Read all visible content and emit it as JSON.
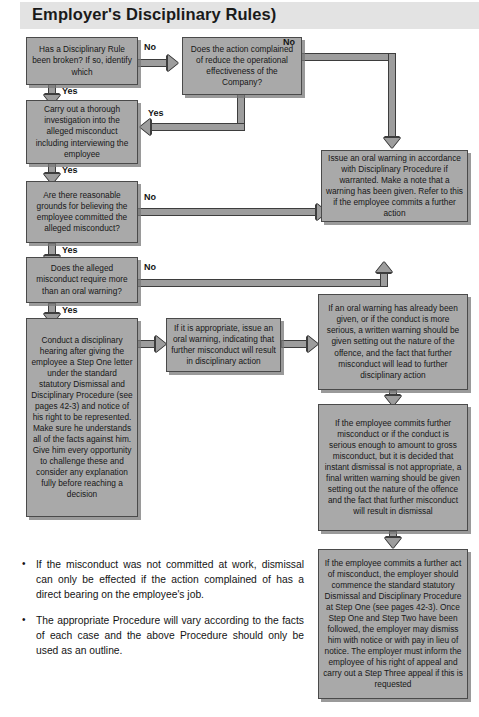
{
  "page": {
    "title": "Employer's Disciplinary Rules)"
  },
  "flowchart": {
    "type": "flowchart",
    "nodes": [
      {
        "id": "n1",
        "text": "Has a Disciplinary Rule been broken? If so, identify which"
      },
      {
        "id": "n2",
        "text": "Does the action complained of reduce the operational effectiveness of the Company?"
      },
      {
        "id": "n3",
        "text": "Carry out a thorough investigation into the alleged misconduct including interviewing the employee"
      },
      {
        "id": "n4",
        "text": "Are there reasonable grounds for believing the employee committed the alleged misconduct?"
      },
      {
        "id": "n5",
        "text": "Issue an oral warning in accordance with Disciplinary Procedure if warranted. Make a note that a warning has been given. Refer to this if the employee commits a further action"
      },
      {
        "id": "n6",
        "text": "Does the alleged misconduct require more than an oral warning?"
      },
      {
        "id": "n7",
        "text": "Conduct a disciplinary hearing after giving the employee a Step One letter under the standard statutory Dismissal and Disciplinary Procedure (see pages 42-3) and notice of his right to be represented. Make sure he understands all of the facts against him. Give him every opportunity to challenge these and consider any explanation fully before reaching a decision"
      },
      {
        "id": "n8",
        "text": "If it is appropriate, issue an oral warning, indicating that further misconduct will result in disciplinary action"
      },
      {
        "id": "n9",
        "text": "If an oral warning has already been given, or if the conduct is more serious, a written warning should be given setting out the nature of the offence, and the fact that further misconduct will lead to further disciplinary action"
      },
      {
        "id": "n10",
        "text": "If the employee commits further misconduct or if the conduct is serious enough to amount to gross misconduct, but it is decided that instant dismissal is not appropriate, a final written warning should be given setting out the nature of the offence and the fact that further misconduct will result in dismissal"
      },
      {
        "id": "n11",
        "text": "If the employee commits a further act of misconduct, the employer should commence the standard statutory Dismissal and Disciplinary Procedure at Step One (see pages 42-3). Once Step One and Step Two have been followed, the employer may dismiss him with notice or with pay in lieu of notice. The employer must inform the employee of his right of appeal and carry out a Step Three appeal if this is requested"
      }
    ],
    "edge_labels": {
      "n1_no": "No",
      "n1_yes": "Yes",
      "n2_no": "No",
      "n2_yes": "Yes",
      "n3_yes": "Yes",
      "n4_no": "No",
      "n4_yes": "Yes",
      "n6_no": "No",
      "n6_yes": "Yes"
    },
    "colors": {
      "node_fill": "#a9a9a9",
      "node_border": "#4a4a4a",
      "connector_fill": "#9d9d9d",
      "connector_border": "#3d3d3d",
      "title_band": "#e3e3e3"
    }
  },
  "notes": {
    "bullet_marker": "•",
    "items": [
      "If the misconduct was not committed at work, dismissal can only be effected if the action complained of has a direct bearing on the employee's job.",
      "The appropriate Procedure will vary according to the facts of each case and the above Procedure should only be used as an outline."
    ]
  }
}
